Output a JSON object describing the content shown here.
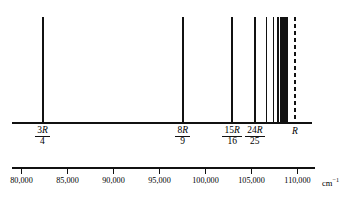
{
  "figure": {
    "kind": "atomic-emission-line-spectrum",
    "unit_label": "cm",
    "unit_exponent": "−1",
    "series_limit_label": "R"
  },
  "axis": {
    "x_min": 78700,
    "x_max": 111700,
    "tick_values": [
      80000,
      85000,
      90000,
      95000,
      100000,
      105000,
      110000
    ],
    "tick_labels": [
      "80,000",
      "85,000",
      "90,000",
      "95,000",
      "100,000",
      "105,000",
      "110,000"
    ],
    "pixel_left": 12,
    "pixel_right": 315
  },
  "labels": [
    {
      "numerator": "3R",
      "denominator": "4",
      "value": 82303
    },
    {
      "numerator": "8R",
      "denominator": "9",
      "value": 97544
    },
    {
      "numerator": "15R",
      "denominator": "16",
      "value": 102879
    },
    {
      "numerator": "24R",
      "denominator": "25",
      "value": 105348
    },
    {
      "numerator": "R",
      "denominator": "",
      "value": 109737
    }
  ],
  "chart_data": {
    "type": "line",
    "title": "",
    "xlabel": "cm−1",
    "ylabel": "",
    "xlim": [
      78700,
      111700
    ],
    "grid": false,
    "legend": "none",
    "categories": [
      "n=2",
      "n=3",
      "n=4",
      "n=5",
      "n=6",
      "n=7",
      "n=8",
      "n=9",
      "n=10",
      "n=11",
      "n=12",
      "n=13",
      "n=14",
      "n=15",
      "n=∞"
    ],
    "x": [
      82303,
      97544,
      102879,
      105348,
      106632,
      107383,
      107863,
      108186,
      108414,
      108580,
      108704,
      108799,
      108873,
      108932,
      109737
    ],
    "values": [
      1,
      1,
      1,
      1,
      1,
      1,
      1,
      1,
      1,
      1,
      1,
      1,
      1,
      1,
      1
    ],
    "annotations": [
      {
        "text": "3R/4",
        "x": 82303
      },
      {
        "text": "8R/9",
        "x": 97544
      },
      {
        "text": "15R/16",
        "x": 102879
      },
      {
        "text": "24R/25",
        "x": 105348
      },
      {
        "text": "R",
        "x": 109737
      }
    ]
  }
}
